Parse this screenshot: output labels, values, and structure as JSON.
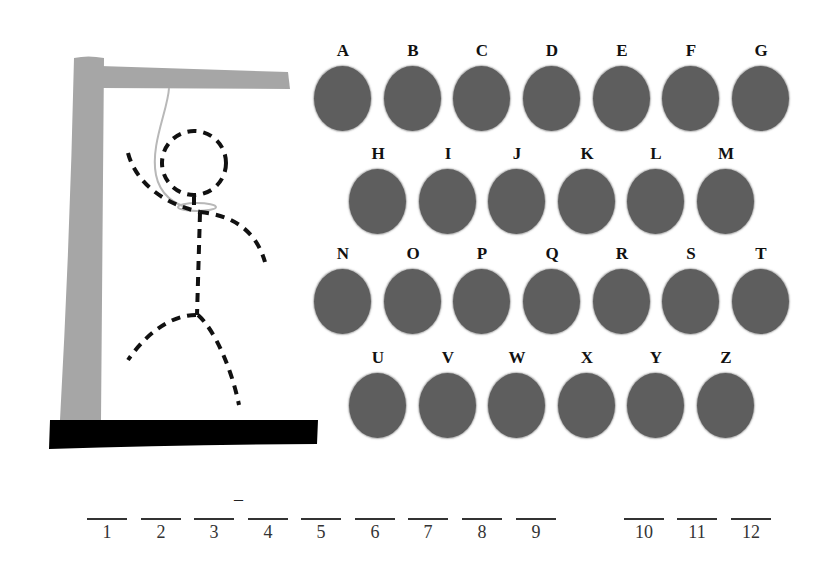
{
  "game": {
    "type": "hangman",
    "colors": {
      "gallows": "#a6a6a6",
      "base": "#000000",
      "rope": "#b8b8b8",
      "figure": "#111111",
      "letter_disc": "#5e5e5e",
      "letter_text": "#111111"
    }
  },
  "keyboard": {
    "rows": [
      {
        "letters": [
          "A",
          "B",
          "C",
          "D",
          "E",
          "F",
          "G"
        ]
      },
      {
        "letters": [
          "H",
          "I",
          "J",
          "K",
          "L",
          "M"
        ]
      },
      {
        "letters": [
          "N",
          "O",
          "P",
          "Q",
          "R",
          "S",
          "T"
        ]
      },
      {
        "letters": [
          "U",
          "V",
          "W",
          "X",
          "Y",
          "Z"
        ]
      }
    ]
  },
  "word": {
    "slots": [
      {
        "number": "1",
        "value": ""
      },
      {
        "number": "2",
        "value": ""
      },
      {
        "number": "3",
        "value": ""
      },
      {
        "number": "4",
        "value": ""
      },
      {
        "number": "5",
        "value": ""
      },
      {
        "number": "6",
        "value": ""
      },
      {
        "number": "7",
        "value": ""
      },
      {
        "number": "8",
        "value": ""
      },
      {
        "number": "9",
        "value": ""
      },
      {
        "number": "10",
        "value": ""
      },
      {
        "number": "11",
        "value": ""
      },
      {
        "number": "12",
        "value": ""
      }
    ],
    "mark": "–"
  }
}
